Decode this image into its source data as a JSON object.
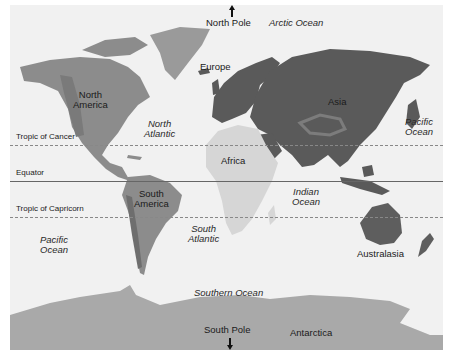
{
  "map": {
    "type": "world-continents",
    "continents": [
      {
        "name": "North America"
      },
      {
        "name": "South America"
      },
      {
        "name": "Europe"
      },
      {
        "name": "Africa"
      },
      {
        "name": "Asia"
      },
      {
        "name": "Australasia"
      },
      {
        "name": "Antarctica"
      }
    ],
    "oceans": [
      {
        "name": "Arctic Ocean"
      },
      {
        "name": "North Atlantic",
        "lines": [
          "North",
          "Atlantic"
        ]
      },
      {
        "name": "South Atlantic",
        "lines": [
          "South",
          "Atlantic"
        ]
      },
      {
        "name": "Indian Ocean",
        "lines": [
          "Indian",
          "Ocean"
        ]
      },
      {
        "name": "Pacific Ocean (west)",
        "lines": [
          "Pacific",
          "Ocean"
        ]
      },
      {
        "name": "Pacific Ocean (east)",
        "lines": [
          "Pacific",
          "Ocean"
        ]
      },
      {
        "name": "Southern Ocean"
      }
    ],
    "latitude_lines": [
      {
        "label": "Tropic of Cancer",
        "style": "dashed"
      },
      {
        "label": "Equator",
        "style": "solid"
      },
      {
        "label": "Tropic of Capricorn",
        "style": "dashed"
      }
    ],
    "poles": {
      "north": "North Pole",
      "south": "South Pole"
    },
    "labels": {
      "north_america": [
        "North",
        "America"
      ],
      "south_america": [
        "South",
        "America"
      ],
      "europe": "Europe",
      "africa": "Africa",
      "asia": "Asia",
      "australasia": "Australasia",
      "antarctica": "Antarctica"
    },
    "colors": {
      "ocean": "#f1f1f1",
      "americas": "#8c8c8c",
      "eurasia": "#5a5a5a",
      "africa": "#d6d6d6",
      "australia": "#5e5e5e",
      "antarctica": "#a9a9a9",
      "greenland": "#9a9a9a"
    }
  }
}
